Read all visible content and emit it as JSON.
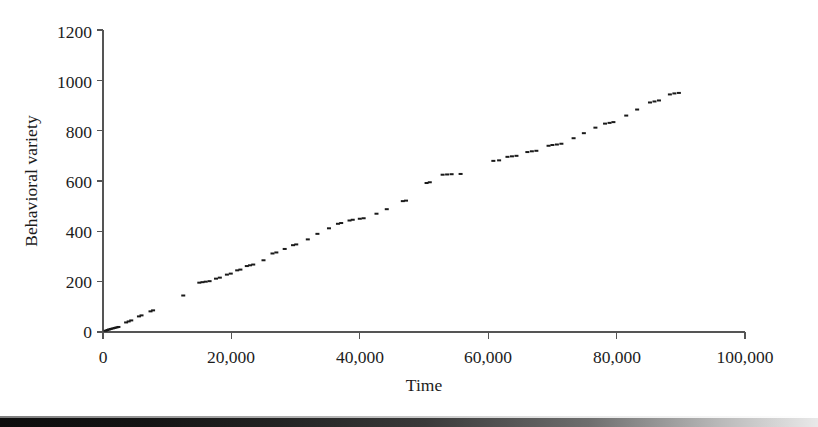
{
  "chart_data": {
    "type": "scatter",
    "title": "",
    "subtitle": "",
    "xlabel": "Time",
    "ylabel": "Behavioral variety",
    "xlim": [
      0,
      100000
    ],
    "ylim": [
      0,
      1200
    ],
    "grid": false,
    "legend": null,
    "legend_position": "none",
    "marker": {
      "shape": "small-dash",
      "color": "#1a1a1a",
      "width_px": 4,
      "height_px": 2
    },
    "axis_color": "#555555",
    "xticks": [
      0,
      20000,
      40000,
      60000,
      80000,
      100000
    ],
    "xtick_labels": [
      "0",
      "20,000",
      "40,000",
      "60,000",
      "80,000",
      "100,000"
    ],
    "yticks": [
      0,
      200,
      400,
      600,
      800,
      1000,
      1200
    ],
    "ytick_labels": [
      "0",
      "200",
      "400",
      "600",
      "800",
      "1000",
      "1200"
    ],
    "annotations": [],
    "series": [
      {
        "name": "Behavioral variety vs Time",
        "points": [
          [
            400,
            5
          ],
          [
            700,
            8
          ],
          [
            950,
            10
          ],
          [
            1200,
            12
          ],
          [
            1500,
            14
          ],
          [
            1800,
            16
          ],
          [
            2100,
            18
          ],
          [
            2400,
            20
          ],
          [
            3600,
            38
          ],
          [
            4000,
            42
          ],
          [
            4400,
            46
          ],
          [
            5600,
            62
          ],
          [
            6000,
            66
          ],
          [
            7400,
            82
          ],
          [
            7800,
            86
          ],
          [
            12500,
            145
          ],
          [
            15000,
            196
          ],
          [
            15500,
            198
          ],
          [
            16000,
            200
          ],
          [
            16600,
            202
          ],
          [
            17600,
            212
          ],
          [
            18200,
            216
          ],
          [
            19300,
            228
          ],
          [
            19900,
            232
          ],
          [
            20900,
            245
          ],
          [
            21400,
            248
          ],
          [
            22400,
            262
          ],
          [
            22900,
            265
          ],
          [
            23400,
            268
          ],
          [
            25000,
            285
          ],
          [
            26400,
            312
          ],
          [
            27000,
            316
          ],
          [
            28300,
            330
          ],
          [
            29600,
            345
          ],
          [
            30100,
            348
          ],
          [
            31900,
            368
          ],
          [
            33400,
            390
          ],
          [
            35200,
            412
          ],
          [
            36600,
            430
          ],
          [
            37100,
            433
          ],
          [
            38400,
            443
          ],
          [
            38900,
            446
          ],
          [
            40000,
            450
          ],
          [
            40600,
            452
          ],
          [
            42600,
            470
          ],
          [
            44200,
            488
          ],
          [
            46700,
            520
          ],
          [
            47200,
            522
          ],
          [
            50400,
            592
          ],
          [
            50900,
            595
          ],
          [
            52900,
            625
          ],
          [
            53600,
            626
          ],
          [
            54300,
            627
          ],
          [
            55700,
            628
          ],
          [
            60800,
            680
          ],
          [
            61700,
            682
          ],
          [
            63000,
            696
          ],
          [
            63700,
            698
          ],
          [
            64400,
            700
          ],
          [
            66100,
            715
          ],
          [
            66800,
            718
          ],
          [
            67500,
            720
          ],
          [
            69400,
            740
          ],
          [
            70000,
            743
          ],
          [
            70700,
            745
          ],
          [
            71400,
            748
          ],
          [
            73300,
            770
          ],
          [
            74900,
            790
          ],
          [
            76700,
            812
          ],
          [
            78200,
            828
          ],
          [
            78900,
            831
          ],
          [
            79500,
            834
          ],
          [
            81500,
            860
          ],
          [
            83200,
            884
          ],
          [
            85200,
            912
          ],
          [
            85900,
            916
          ],
          [
            86600,
            920
          ],
          [
            88300,
            944
          ],
          [
            89000,
            948
          ],
          [
            89700,
            950
          ]
        ]
      }
    ]
  }
}
